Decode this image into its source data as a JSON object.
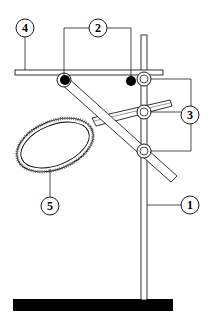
{
  "diagram": {
    "colors": {
      "line": "#000000",
      "fill": "#ffffff",
      "base": "#000000",
      "hatch": "#555555"
    },
    "labels": [
      {
        "id": "1",
        "text": "1",
        "part": "vertical-rod"
      },
      {
        "id": "2",
        "text": "2",
        "part": "screw-points"
      },
      {
        "id": "3",
        "text": "3",
        "part": "clamp-joints"
      },
      {
        "id": "4",
        "text": "4",
        "part": "horizontal-bar"
      },
      {
        "id": "5",
        "text": "5",
        "part": "ring"
      }
    ]
  }
}
